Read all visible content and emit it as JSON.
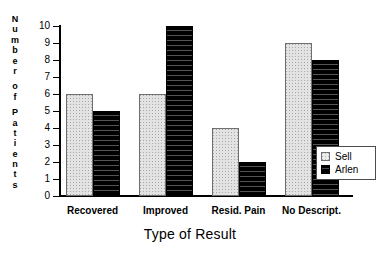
{
  "chart_data": {
    "type": "bar",
    "title": "",
    "xlabel": "Type of Result",
    "ylabel": "Number of Patients",
    "categories": [
      "Recovered",
      "Improved",
      "Resid. Pain",
      "No Descript."
    ],
    "series": [
      {
        "name": "Sell",
        "values": [
          6,
          6,
          4,
          9
        ],
        "color": "#e3e3e3",
        "pattern": "stipple"
      },
      {
        "name": "Arlen",
        "values": [
          5,
          10,
          2,
          8
        ],
        "color": "#000000",
        "pattern": "horizontal-stripe"
      }
    ],
    "ylim": [
      0,
      10
    ],
    "yticks": [
      0,
      1,
      2,
      3,
      4,
      5,
      6,
      7,
      8,
      9,
      10
    ],
    "ytick_labels": [
      "0",
      "1",
      "2",
      "3",
      "4",
      "5",
      "6",
      "7",
      "8",
      "9",
      "10"
    ],
    "grid": false,
    "legend_position": "bottom-right-inside"
  },
  "axes": {
    "y_title_letters": [
      "N",
      "u",
      "m",
      "b",
      "e",
      "r",
      "",
      "o",
      "f",
      "",
      "P",
      "a",
      "t",
      "i",
      "e",
      "n",
      "t",
      "s"
    ],
    "y_title_text": "Number of Patients",
    "x_title_text": "Type of Result"
  },
  "legend": {
    "entries": [
      {
        "label": "Sell"
      },
      {
        "label": "Arlen"
      }
    ]
  }
}
